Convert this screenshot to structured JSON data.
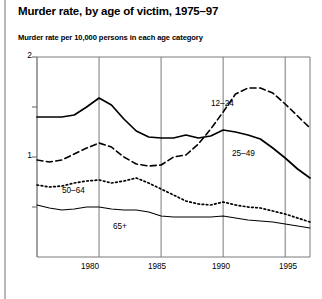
{
  "figure": {
    "title": "Murder rate, by age of victim, 1975–97",
    "subtitle": "Murder rate per 10,000 persons in each age category"
  },
  "axis": {
    "y_ticks": [
      {
        "value": 2,
        "label": "2"
      },
      {
        "value": 1,
        "label": "1"
      }
    ],
    "y_minor_ticks": [
      1.5,
      0.5
    ],
    "x_ticks": [
      {
        "value": 1980,
        "label": "1980"
      },
      {
        "value": 1985,
        "label": "1985"
      },
      {
        "value": 1990,
        "label": "1990"
      },
      {
        "value": 1995,
        "label": "1995"
      }
    ]
  },
  "series_labels": {
    "age_12_24": "12–24",
    "age_25_49": "25–49",
    "age_50_64": "50–64",
    "age_65_plus": "65+"
  },
  "colors": {
    "ink": "#000000",
    "axis": "#7a7a7a",
    "grid": "#7a7a7a",
    "page_rule": "#b9b9b9",
    "background": "#ffffff"
  },
  "chart_data": {
    "type": "line",
    "title": "Murder rate, by age of victim, 1975–97",
    "subtitle": "Murder rate per 10,000 persons in each age category",
    "xlabel": "",
    "ylabel": "Murder rate per 10,000 persons in each age category",
    "xlim": [
      1975,
      1997
    ],
    "ylim": [
      0,
      2
    ],
    "yticks": [
      1,
      2
    ],
    "xticks": [
      1980,
      1985,
      1990,
      1995
    ],
    "grid": "vertical",
    "legend": "inline-annotations",
    "x": [
      1975,
      1976,
      1977,
      1978,
      1979,
      1980,
      1981,
      1982,
      1983,
      1984,
      1985,
      1986,
      1987,
      1988,
      1989,
      1990,
      1991,
      1992,
      1993,
      1994,
      1995,
      1996,
      1997
    ],
    "series": [
      {
        "name": "12–24",
        "style": "dashed",
        "label_position": {
          "x": 1991,
          "y": 1.52
        },
        "values": [
          0.97,
          0.95,
          0.97,
          1.03,
          1.09,
          1.14,
          1.1,
          1.0,
          0.93,
          0.91,
          0.92,
          1.0,
          1.02,
          1.13,
          1.28,
          1.45,
          1.63,
          1.69,
          1.69,
          1.64,
          1.53,
          1.41,
          1.29
        ]
      },
      {
        "name": "25–49",
        "style": "solid",
        "label_position": {
          "x": 1993,
          "y": 1.02
        },
        "values": [
          1.4,
          1.4,
          1.4,
          1.42,
          1.5,
          1.59,
          1.52,
          1.38,
          1.26,
          1.2,
          1.19,
          1.19,
          1.22,
          1.19,
          1.21,
          1.27,
          1.25,
          1.22,
          1.18,
          1.09,
          0.99,
          0.88,
          0.79
        ]
      },
      {
        "name": "50–64",
        "style": "dotted",
        "label_position": {
          "x": 1978,
          "y": 0.65
        },
        "values": [
          0.72,
          0.7,
          0.71,
          0.74,
          0.76,
          0.77,
          0.74,
          0.76,
          0.79,
          0.74,
          0.68,
          0.62,
          0.56,
          0.53,
          0.52,
          0.55,
          0.52,
          0.5,
          0.49,
          0.46,
          0.43,
          0.39,
          0.35
        ]
      },
      {
        "name": "65+",
        "style": "solid-thin",
        "label_position": {
          "x": 1982,
          "y": 0.3
        },
        "values": [
          0.52,
          0.49,
          0.47,
          0.48,
          0.5,
          0.5,
          0.48,
          0.47,
          0.47,
          0.45,
          0.41,
          0.4,
          0.4,
          0.4,
          0.4,
          0.41,
          0.39,
          0.37,
          0.36,
          0.35,
          0.33,
          0.31,
          0.29
        ]
      }
    ]
  }
}
